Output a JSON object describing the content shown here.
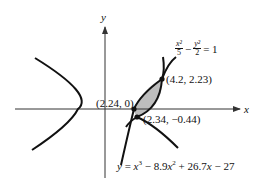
{
  "diagram": {
    "axes": {
      "x_label": "x",
      "y_label": "y"
    },
    "curves": {
      "hyperbola": {
        "numerator_x": "x²",
        "denominator_x": "5",
        "minus": "−",
        "numerator_y": "y²",
        "denominator_y": "2",
        "equals": "= 1"
      },
      "cubic": {
        "lhs": "y",
        "rhs_prefix": " = ",
        "term1": "x",
        "exp1": "3",
        "term2": " − 8.9",
        "term2_var": "x",
        "exp2": "2",
        "term3": " + 26.7",
        "term3_var": "x",
        "term4": " − 27"
      }
    },
    "points": [
      {
        "label": "(2.24, 0)"
      },
      {
        "label": "(2.34, −0.44)"
      },
      {
        "label": "(4.2, 2.23)"
      }
    ],
    "colors": {
      "curve": "#111111",
      "shade": "#bdbdbd",
      "axis": "#333333"
    }
  }
}
